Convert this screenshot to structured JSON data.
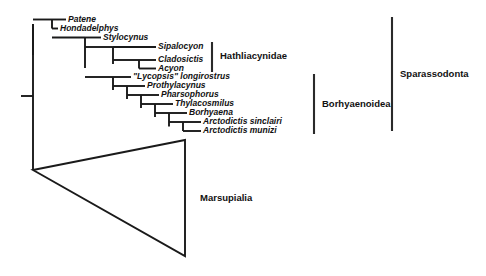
{
  "figure": {
    "width": 486,
    "height": 276,
    "background": "#ffffff",
    "line_color": "#1a1a1a"
  },
  "taxa": [
    {
      "id": "patene",
      "label": "Patene",
      "x": 68,
      "y": 19.5,
      "tip_x": 52
    },
    {
      "id": "hondadelphys",
      "label": "Hondadelphys",
      "x": 60,
      "y": 28.5,
      "tip_x": 52
    },
    {
      "id": "stylocynus",
      "label": "Stylocynus",
      "x": 103,
      "y": 37.5,
      "tip_x": 85
    },
    {
      "id": "sipalocyon",
      "label": "Sipalocyon",
      "x": 158,
      "y": 47.0,
      "tip_x": 113
    },
    {
      "id": "cladosictis",
      "label": "Cladosictis",
      "x": 158,
      "y": 60.0,
      "tip_x": 139
    },
    {
      "id": "acyon",
      "label": "Acyon",
      "x": 158,
      "y": 68.5,
      "tip_x": 139
    },
    {
      "id": "lycopsis",
      "label": "\"Lycopsis\" longirostrus",
      "x": 133,
      "y": 77.0,
      "tip_x": 113
    },
    {
      "id": "prothylacynus",
      "label": "Prothylacynus",
      "x": 147,
      "y": 86.0,
      "tip_x": 127
    },
    {
      "id": "pharsophorus",
      "label": "Pharsophorus",
      "x": 161,
      "y": 95.0,
      "tip_x": 141
    },
    {
      "id": "thylacosmilus",
      "label": "Thylacosmilus",
      "x": 175,
      "y": 104.0,
      "tip_x": 155
    },
    {
      "id": "borhyaena",
      "label": "Borhyaena",
      "x": 189,
      "y": 113.0,
      "tip_x": 169
    },
    {
      "id": "arctodictis_sinclairi",
      "label": "Arctodictis sinclairi",
      "x": 203,
      "y": 122.0,
      "tip_x": 183
    },
    {
      "id": "arctodictis_munizi",
      "label": "Arctodictis munizi",
      "x": 203,
      "y": 131.0,
      "tip_x": 183
    }
  ],
  "clade_brackets": [
    {
      "id": "hathliacynidae",
      "label": "Hathliacynidae",
      "bar_x": 212,
      "bar_y1": 42.0,
      "bar_y2": 72.0,
      "label_x": 220,
      "label_y": 56.5
    },
    {
      "id": "borhyaenoidea",
      "label": "Borhyaenoidea",
      "bar_x": 314,
      "bar_y1": 74.0,
      "bar_y2": 134.0,
      "label_x": 322,
      "label_y": 104.0
    },
    {
      "id": "sparassodonta",
      "label": "Sparassodonta",
      "bar_x": 392,
      "bar_y1": 17.0,
      "bar_y2": 131.0,
      "label_x": 400,
      "label_y": 74.0
    }
  ],
  "collapsed_clade": {
    "id": "marsupialia",
    "label": "Marsupialia",
    "apex_x": 33,
    "apex_y": 170,
    "base_x": 185,
    "base_y_top": 140,
    "base_y_bottom": 256,
    "label_x": 200,
    "label_y": 198
  },
  "root": {
    "stem_x": 33,
    "stem_top_y": 24,
    "stem_bottom_y": 170,
    "tick_x": 21,
    "tick_y": 96
  },
  "internal_nodes": [
    {
      "id": "node-patene-hondadelphys",
      "x": 52,
      "y1": 19.5,
      "y2": 28.5,
      "parent_x": 33
    },
    {
      "id": "node-sparassodonta-base",
      "x": 33,
      "y1": 24.0,
      "y2": 55.0,
      "parent_x": 33
    },
    {
      "id": "node-stylocynus-sister",
      "x": 85,
      "y1": 37.5,
      "y2": 68.0,
      "parent_x": 52
    },
    {
      "id": "node-hathliacynidae",
      "x": 113,
      "y1": 47.0,
      "y2": 64.0,
      "parent_x": 85
    },
    {
      "id": "node-cladosictis-acyon",
      "x": 139,
      "y1": 60.0,
      "y2": 68.5,
      "parent_x": 113
    },
    {
      "id": "node-borhyaenoidea",
      "x": 113,
      "y1": 77.0,
      "y2": 90.0,
      "parent_x": 85
    },
    {
      "id": "node-prothylacynus",
      "x": 127,
      "y1": 86.0,
      "y2": 99.0,
      "parent_x": 113
    },
    {
      "id": "node-pharsophorus",
      "x": 141,
      "y1": 95.0,
      "y2": 108.0,
      "parent_x": 127
    },
    {
      "id": "node-thylacosmilus",
      "x": 155,
      "y1": 104.0,
      "y2": 117.0,
      "parent_x": 141
    },
    {
      "id": "node-borhyaena",
      "x": 169,
      "y1": 113.0,
      "y2": 126.5,
      "parent_x": 155
    },
    {
      "id": "node-arctodictis",
      "x": 183,
      "y1": 122.0,
      "y2": 131.0,
      "parent_x": 169
    }
  ],
  "chart_data": {
    "type": "cladogram",
    "tips": [
      "Patene",
      "Hondadelphys",
      "Stylocynus",
      "Sipalocyon",
      "Cladosictis",
      "Acyon",
      "\"Lycopsis\" longirostrus",
      "Prothylacynus",
      "Pharsophorus",
      "Thylacosmilus",
      "Borhyaena",
      "Arctodictis sinclairi",
      "Arctodictis munizi",
      "Marsupialia"
    ],
    "newick": "(Marsupialia,(Patene,Hondadelphys,(Stylocynus,((Sipalocyon,(Cladosictis,Acyon)),(\"Lycopsis\" longirostrus,(Prothylacynus,(Pharsophorus,(Thylacosmilus,(Borhyaena,(Arctodictis sinclairi,Arctodictis munizi)))))))))",
    "named_clades": [
      {
        "name": "Hathliacynidae",
        "members": [
          "Sipalocyon",
          "Cladosictis",
          "Acyon"
        ]
      },
      {
        "name": "Borhyaenoidea",
        "members": [
          "\"Lycopsis\" longirostrus",
          "Prothylacynus",
          "Pharsophorus",
          "Thylacosmilus",
          "Borhyaena",
          "Arctodictis sinclairi",
          "Arctodictis munizi"
        ]
      },
      {
        "name": "Sparassodonta",
        "members": [
          "Patene",
          "Hondadelphys",
          "Stylocynus",
          "Hathliacynidae",
          "Borhyaenoidea"
        ]
      },
      {
        "name": "Marsupialia",
        "members": [
          "collapsed outgroup triangle"
        ]
      }
    ],
    "legend": [],
    "grid": false
  }
}
